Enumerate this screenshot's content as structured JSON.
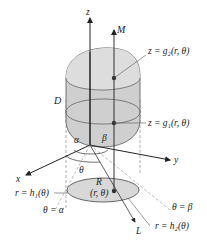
{
  "figure": {
    "colors": {
      "solid_fill": "#cfcfcf",
      "solid_top": "#dcdcdc",
      "ellipse_fill": "#d8d8d8",
      "stroke": "#333333",
      "dashed": "#999999",
      "background": "#ffffff"
    },
    "axes": {
      "z": "z",
      "x": "x",
      "y": "y"
    },
    "labels": {
      "M": "M",
      "L": "L",
      "D": "D",
      "R": "R",
      "point": "(r, θ)",
      "upper_surface": "z = g₂(r, θ)",
      "lower_surface": "z = g₁(r, θ)",
      "alpha": "α",
      "beta": "β",
      "theta": "θ",
      "inner_curve": "r = h₁(θ)",
      "outer_curve": "r = h₂(θ)",
      "ray_alpha": "θ = α",
      "ray_beta": "θ = β"
    }
  }
}
